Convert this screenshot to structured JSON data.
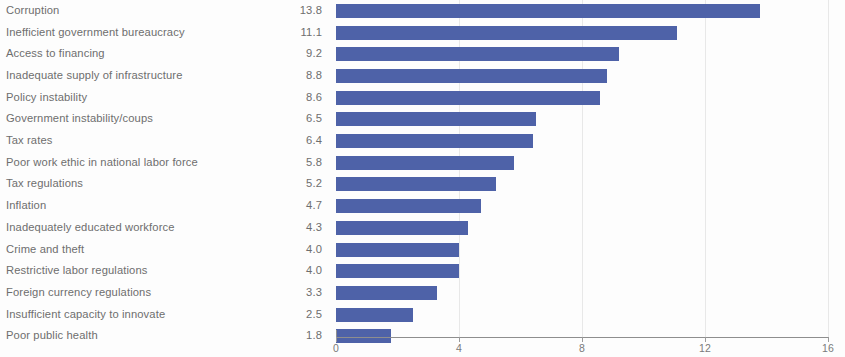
{
  "chart_data": {
    "type": "bar",
    "orientation": "horizontal",
    "title": "",
    "subtitle": "",
    "xlabel": "",
    "ylabel": "",
    "grid": true,
    "legend": null,
    "xlim": [
      0,
      16
    ],
    "xticks": [
      "0",
      "4",
      "8",
      "12",
      "16"
    ],
    "xtick_values": [
      0,
      4,
      8,
      12,
      16
    ],
    "categories": [
      "Corruption",
      "Inefficient government bureaucracy",
      "Access to financing",
      "Inadequate supply of infrastructure",
      "Policy instability",
      "Government instability/coups",
      "Tax rates",
      "Poor work ethic in national labor force",
      "Tax regulations",
      "Inflation",
      "Inadequately educated workforce",
      "Crime and theft",
      "Restrictive labor regulations",
      "Foreign currency regulations",
      "Insufficient capacity to innovate",
      "Poor public health"
    ],
    "values": [
      13.8,
      11.1,
      9.2,
      8.8,
      8.6,
      6.5,
      6.4,
      5.8,
      5.2,
      4.7,
      4.3,
      4.0,
      4.0,
      3.3,
      2.5,
      1.8
    ],
    "value_labels": [
      "13.8",
      "11.1",
      "9.2",
      "8.8",
      "8.6",
      "6.5",
      "6.4",
      "5.8",
      "5.2",
      "4.7",
      "4.3",
      "4.0",
      "4.0",
      "3.3",
      "2.5",
      "1.8"
    ],
    "bar_color": "#4e62a8",
    "text_color": "#6e6e6e",
    "axis_color": "#8e8e8e",
    "grid_color": "#e8e8e8",
    "background_color": "#fdfdfd"
  }
}
